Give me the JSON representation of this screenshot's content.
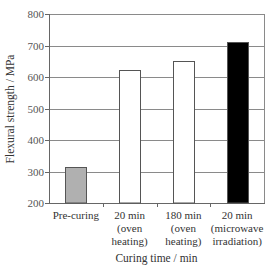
{
  "chart_data": {
    "type": "bar",
    "title": "",
    "xlabel": "Curing time / min",
    "ylabel": "Flexural strength / MPa",
    "ylim": [
      200,
      800
    ],
    "yticks": [
      200,
      300,
      400,
      500,
      600,
      700,
      800
    ],
    "grid": true,
    "legend": null,
    "categories": [
      [
        "Pre-curing"
      ],
      [
        "20 min",
        "(oven",
        "heating)"
      ],
      [
        "180 min",
        "(oven",
        "heating)"
      ],
      [
        "20 min",
        "(microwave",
        "irradiation)"
      ]
    ],
    "category_labels": [
      "Pre-curing",
      "20 min (oven heating)",
      "180 min (oven heating)",
      "20 min (microwave irradiation)"
    ],
    "values": [
      315,
      622,
      651,
      712
    ],
    "bar_colors": [
      "#b0b0b0",
      "#ffffff",
      "#ffffff",
      "#000000"
    ]
  },
  "colors": {
    "axis": "#666666",
    "grid": "#8a8a8a",
    "bar_edge": "#555555"
  }
}
